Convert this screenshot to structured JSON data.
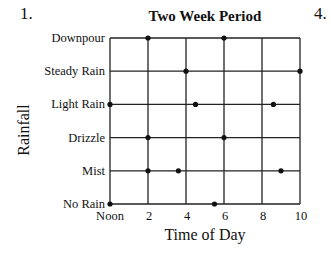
{
  "question_numbers": {
    "left": "1.",
    "right": "4."
  },
  "chart_data": {
    "type": "scatter",
    "title": "Two Week Period",
    "xlabel": "Time of Day",
    "ylabel": "Rainfall",
    "x_ticks": [
      {
        "value": 0,
        "label": "Noon"
      },
      {
        "value": 2,
        "label": "2"
      },
      {
        "value": 4,
        "label": "4"
      },
      {
        "value": 6,
        "label": "6"
      },
      {
        "value": 8,
        "label": "8"
      },
      {
        "value": 10,
        "label": "10"
      }
    ],
    "y_categories": [
      "No Rain",
      "Mist",
      "Drizzle",
      "Light Rain",
      "Steady Rain",
      "Downpour"
    ],
    "xlim": [
      0,
      10
    ],
    "grid": true,
    "legend": null,
    "points": [
      {
        "x": 2,
        "y": "Downpour"
      },
      {
        "x": 6,
        "y": "Downpour"
      },
      {
        "x": 4,
        "y": "Steady Rain"
      },
      {
        "x": 10,
        "y": "Steady Rain"
      },
      {
        "x": 0,
        "y": "Light Rain"
      },
      {
        "x": 4.5,
        "y": "Light Rain"
      },
      {
        "x": 8.6,
        "y": "Light Rain"
      },
      {
        "x": 2,
        "y": "Drizzle"
      },
      {
        "x": 6,
        "y": "Drizzle"
      },
      {
        "x": 2,
        "y": "Mist"
      },
      {
        "x": 3.6,
        "y": "Mist"
      },
      {
        "x": 9,
        "y": "Mist"
      },
      {
        "x": 0,
        "y": "No Rain"
      },
      {
        "x": 5.5,
        "y": "No Rain"
      }
    ]
  },
  "colors": {
    "line": "#222222",
    "point": "#111111",
    "background": "#ffffff"
  }
}
